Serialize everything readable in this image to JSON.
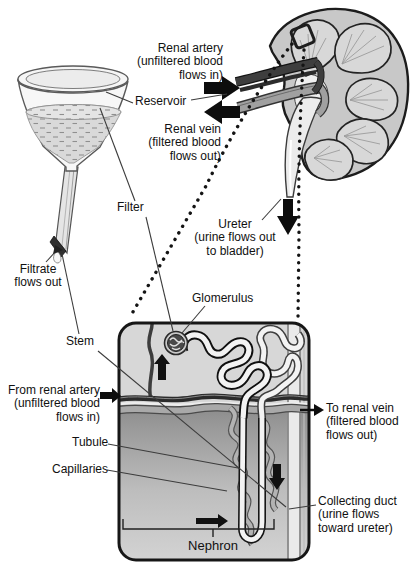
{
  "figure": {
    "funnel": {
      "labels": {
        "reservoir": "Reservoir",
        "filter": "Filter",
        "stem": "Stem",
        "filtrate_flows_out": "Filtrate\nflows out"
      }
    },
    "kidney": {
      "labels": {
        "renal_artery": "Renal artery\n(unfiltered blood\nflows in)",
        "renal_vein": "Renal vein\n(filtered blood\nflows out)",
        "ureter": "Ureter\n(urine flows out\nto bladder)"
      }
    },
    "nephron_panel": {
      "labels": {
        "glomerulus": "Glomerulus",
        "from_renal_artery": "From renal artery\n(unfiltered blood\nflows in)",
        "to_renal_vein": "To renal vein\n(filtered blood\nflows out)",
        "tubule": "Tubule",
        "capillaries": "Capillaries",
        "collecting_duct": "Collecting duct\n(urine flows\ntoward ureter)",
        "nephron": "Nephron"
      }
    },
    "colors": {
      "background": "#ffffff",
      "panel_fill": "#d7d7d7",
      "medulla_shade": "#8d8d8d",
      "artery": "#2b2b2b",
      "vein": "#a9a9a9",
      "outline": "#161616",
      "tubule_fill": "#f3f3f3",
      "text": "#111111"
    }
  }
}
